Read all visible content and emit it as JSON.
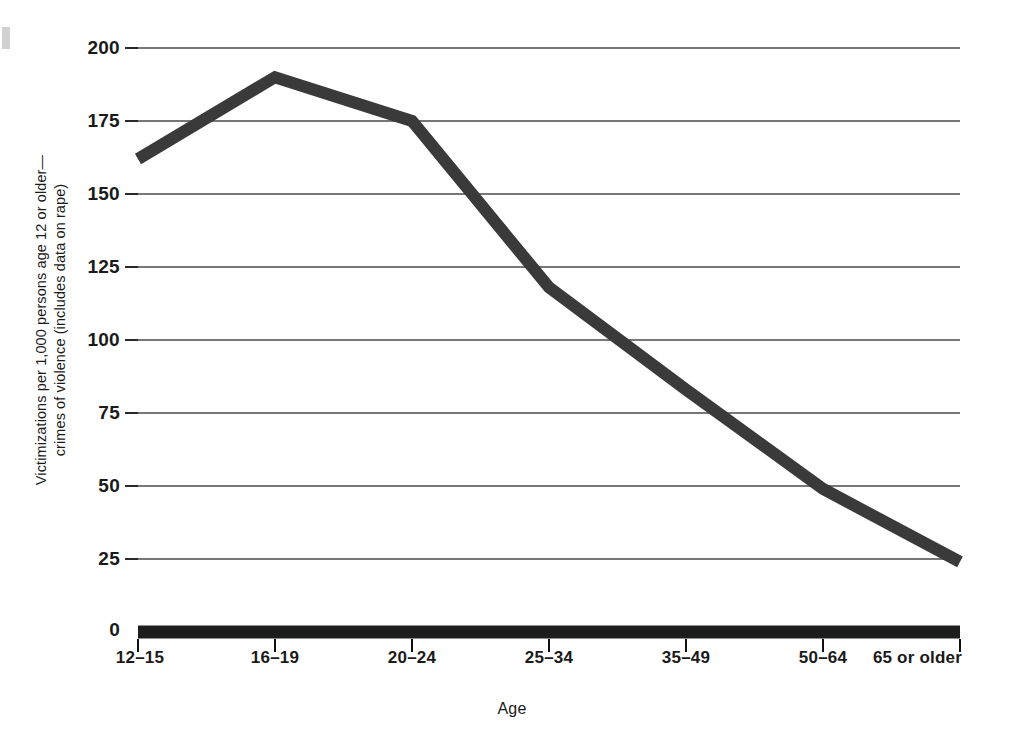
{
  "figure": {
    "y_axis_title_line1": "Victimizations per 1,000 persons age 12 or older—",
    "y_axis_title_line2": "crimes of violence (includes data on rape)",
    "x_axis_title": "Age"
  },
  "colors": {
    "line": "#3a3a3a",
    "axis": "#111111",
    "grid": "#4a4a4a",
    "text": "#1a1a1a",
    "background": "#ffffff"
  },
  "chart_data": {
    "type": "line",
    "title": "",
    "subtitle": "",
    "xlabel": "Age",
    "ylabel": "Victimizations per 1,000 persons age 12 or older—crimes of violence (includes data on rape)",
    "categories": [
      "12–15",
      "16–19",
      "20–24",
      "25–34",
      "35–49",
      "50–64",
      "65 or older"
    ],
    "values": [
      162,
      190,
      175,
      118,
      83,
      49,
      24
    ],
    "series": [
      {
        "name": "Crimes of violence",
        "values": [
          162,
          190,
          175,
          118,
          83,
          49,
          24
        ]
      }
    ],
    "ylim": [
      0,
      200
    ],
    "yticks": [
      0,
      25,
      50,
      75,
      100,
      125,
      150,
      175,
      200
    ],
    "ytick_labels": [
      "0",
      "25",
      "50",
      "75",
      "100",
      "125",
      "150",
      "175",
      "200"
    ],
    "xtick_labels": [
      "12–15",
      "16–19",
      "20–24",
      "25–34",
      "35–49",
      "50–64",
      "65 or older"
    ],
    "grid": true,
    "grid_axis": "y",
    "legend": false,
    "legend_position": "none",
    "line_width_px": 12,
    "annotations": []
  },
  "geometry": {
    "plot_left": 138,
    "plot_right": 960,
    "plot_top": 48,
    "plot_bottom": 632
  }
}
